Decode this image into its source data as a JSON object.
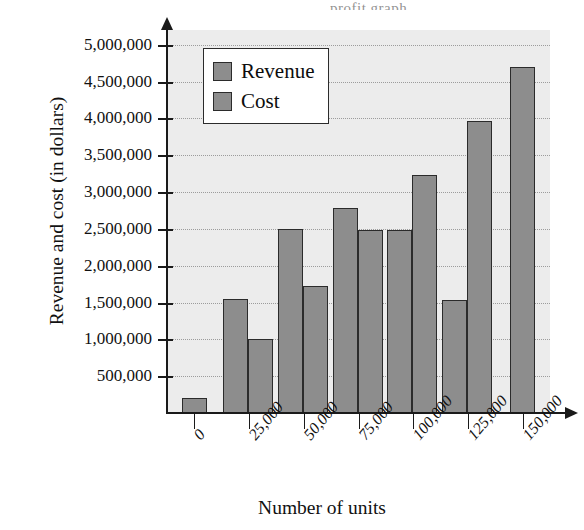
{
  "figure": {
    "cropped_title_fragment": "profit graph",
    "background_color": "#ececec",
    "bar_fill_color": "#8d8d8d",
    "bar_border_color": "#2b2b2b",
    "gridline_color": "#9c9c9c"
  },
  "legend": {
    "position": "top-left-inside",
    "items": [
      {
        "label": "Revenue",
        "swatch_name": "legend-swatch-revenue"
      },
      {
        "label": "Cost",
        "swatch_name": "legend-swatch-cost"
      }
    ]
  },
  "chart_data": {
    "type": "bar",
    "title": "",
    "xlabel": "Number of units",
    "ylabel": "Revenue and cost (in dollars)",
    "categories": [
      "0",
      "25,000",
      "50,000",
      "75,000",
      "100,000",
      "125,000",
      "150,000"
    ],
    "series": [
      {
        "name": "Revenue",
        "values": [
          0,
          1550000,
          2500000,
          2790000,
          2480000,
          1530000,
          0
        ]
      },
      {
        "name": "Cost",
        "values": [
          200000,
          1000000,
          1730000,
          2490000,
          3230000,
          3970000,
          4700000
        ]
      }
    ],
    "ylim": [
      0,
      5200000
    ],
    "yticks": [
      500000,
      1000000,
      1500000,
      2000000,
      2500000,
      3000000,
      3500000,
      4000000,
      4500000,
      5000000
    ],
    "ytick_labels": [
      "500,000",
      "1,000,000",
      "1,500,000",
      "2,000,000",
      "2,500,000",
      "3,000,000",
      "3,500,000",
      "4,000,000",
      "4,500,000",
      "5,000,000"
    ],
    "grid": true,
    "grid_axis": "y",
    "legend_position": "upper left",
    "xtick_label_rotation": -50,
    "axis_style": "arrow-headed"
  }
}
